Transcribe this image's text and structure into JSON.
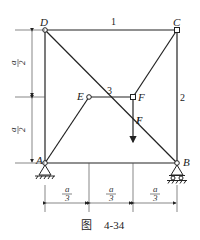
{
  "figure": {
    "caption_prefix": "图",
    "caption_number": "4-34"
  },
  "nodes": {
    "A": "A",
    "B": "B",
    "C": "C",
    "D": "D",
    "E": "E",
    "F": "F"
  },
  "members": {
    "m1": "1",
    "m2": "2",
    "m3": "3"
  },
  "load": {
    "label": "F"
  },
  "dimensions": {
    "vertical": [
      {
        "num": "a",
        "den": "2"
      },
      {
        "num": "a",
        "den": "2"
      }
    ],
    "horizontal": [
      {
        "num": "a",
        "den": "3"
      },
      {
        "num": "a",
        "den": "3"
      },
      {
        "num": "a",
        "den": "3"
      }
    ]
  }
}
